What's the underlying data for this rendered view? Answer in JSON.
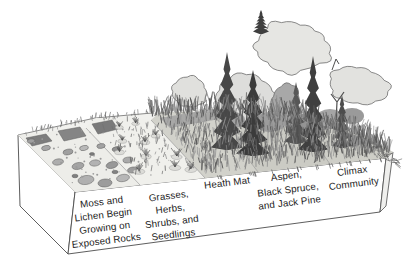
{
  "palette": {
    "ink": "#1c1c1c",
    "paper": "#ffffff",
    "canopy": "#dfdfdc",
    "conifer": "#424242",
    "rock": "#a6a6a6",
    "heath": "#cfcfc8"
  },
  "diagram": {
    "stages": [
      {
        "id": "moss-lichen",
        "lines": [
          "Moss and",
          "Lichen Begin",
          "Growing on",
          "Exposed Rocks"
        ]
      },
      {
        "id": "grasses-herbs",
        "lines": [
          "Grasses,",
          "Herbs,",
          "Shrubs, and",
          "Seedlings"
        ]
      },
      {
        "id": "heath-mat",
        "lines": [
          "Heath Mat"
        ]
      },
      {
        "id": "aspen-spruce-pine",
        "lines": [
          "Aspen,",
          "Black Spruce,",
          "and Jack Pine"
        ]
      },
      {
        "id": "climax-community",
        "lines": [
          "Climax",
          "Community"
        ]
      }
    ]
  }
}
